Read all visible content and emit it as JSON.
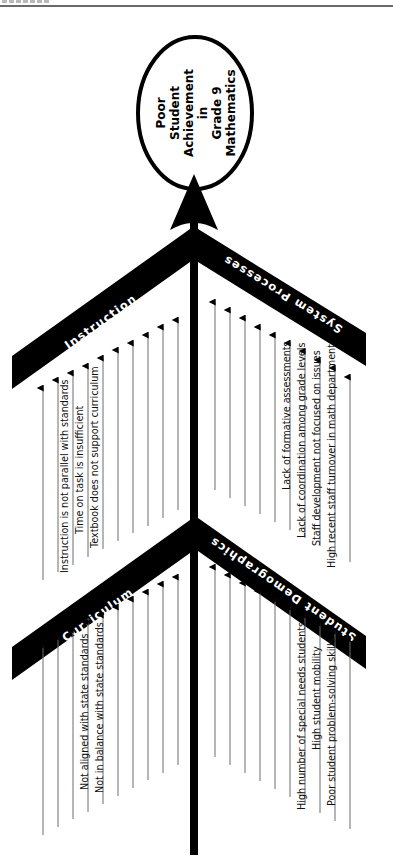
{
  "diagram": {
    "type": "fishbone",
    "orientation": "rotated-90-ccw",
    "effect": {
      "lines": [
        "Poor",
        "Student",
        "Achievement",
        "in",
        "Grade 9",
        "Mathematics"
      ]
    },
    "categories": [
      {
        "id": "instruction",
        "label": "Instruction",
        "causes": [
          "Instruction is not parallel with standards",
          "Time on task is insufficient",
          "Textbook does not support curriculum"
        ]
      },
      {
        "id": "system-processes",
        "label": "System Processes",
        "causes": [
          "Lack of formative assessments",
          "Lack of coordination among grade levels",
          "Staff development not focused on issues",
          "High recent staff turnover in math department"
        ]
      },
      {
        "id": "curriculum",
        "label": "Curriculum",
        "causes": [
          "Not aligned with state standards",
          "Not in balance with state standards"
        ]
      },
      {
        "id": "student-demographics",
        "label": "Student Demographics",
        "causes": [
          "High number of special needs students",
          "High student mobility",
          "Poor student problem-solving skills"
        ]
      }
    ],
    "colors": {
      "bone": "#000000",
      "rib": "#6d6d6d",
      "background": "#ffffff"
    }
  }
}
